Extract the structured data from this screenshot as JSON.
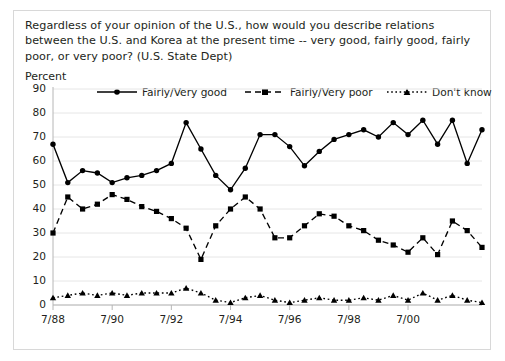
{
  "question": "Regardless of your opinion of the U.S., how would you describe relations between the U.S. and Korea at the present time -- very good, fairly good, fairly poor, or very poor? (U.S. State Dept)",
  "axis_title": "Percent",
  "legend": [
    {
      "label": "Fairly/Very good",
      "style": "solid-circle",
      "color": "#000000"
    },
    {
      "label": "Fairly/Very poor",
      "style": "dashed-square",
      "color": "#000000"
    },
    {
      "label": "Don't know",
      "style": "dotted-triangle",
      "color": "#000000"
    }
  ],
  "chart_data": {
    "type": "line",
    "title": "",
    "subtitle": "",
    "xlabel": "",
    "ylabel": "Percent",
    "ylim": [
      0,
      90
    ],
    "ytick_values": [
      0,
      10,
      20,
      30,
      40,
      50,
      60,
      70,
      80,
      90
    ],
    "ytick_labels": [
      "0",
      "10",
      "20",
      "30",
      "40",
      "50",
      "60",
      "70",
      "80",
      "90"
    ],
    "grid": true,
    "legend_position": "top",
    "xtick_labels": [
      "7/88",
      "7/90",
      "7/92",
      "7/94",
      "7/96",
      "7/98",
      "7/00"
    ],
    "xtick_indices": [
      0,
      4,
      8,
      12,
      16,
      20,
      24
    ],
    "x": [
      "7/88",
      "1/89",
      "7/89",
      "1/90",
      "7/90",
      "1/91",
      "7/91",
      "1/92",
      "7/92",
      "1/93",
      "7/93",
      "1/94",
      "7/94",
      "1/95",
      "7/95",
      "1/96",
      "7/96",
      "1/97",
      "7/97",
      "1/98",
      "7/98",
      "1/99",
      "7/99",
      "1/00",
      "7/00",
      "1/01",
      "7/01",
      "1/02",
      "7/02",
      "1/03"
    ],
    "series": [
      {
        "name": "Fairly/Very good",
        "marker": "circle",
        "line": "solid",
        "color": "#000000",
        "values": [
          67,
          51,
          56,
          55,
          51,
          53,
          54,
          56,
          59,
          76,
          65,
          54,
          48,
          57,
          71,
          71,
          66,
          58,
          64,
          69,
          71,
          73,
          70,
          76,
          71,
          77,
          67,
          77,
          59,
          73
        ]
      },
      {
        "name": "Fairly/Very poor",
        "marker": "square",
        "line": "dashed",
        "color": "#000000",
        "values": [
          30,
          45,
          40,
          42,
          46,
          44,
          41,
          39,
          36,
          32,
          19,
          33,
          40,
          45,
          40,
          28,
          28,
          33,
          38,
          37,
          33,
          31,
          27,
          25,
          22,
          28,
          21,
          35,
          31,
          24
        ]
      },
      {
        "name": "Don't know",
        "marker": "triangle",
        "line": "dotted",
        "color": "#000000",
        "values": [
          3,
          4,
          5,
          4,
          5,
          4,
          5,
          5,
          5,
          7,
          5,
          2,
          1,
          3,
          4,
          2,
          1,
          2,
          3,
          2,
          2,
          3,
          2,
          4,
          2,
          5,
          2,
          4,
          2,
          1
        ]
      }
    ]
  }
}
